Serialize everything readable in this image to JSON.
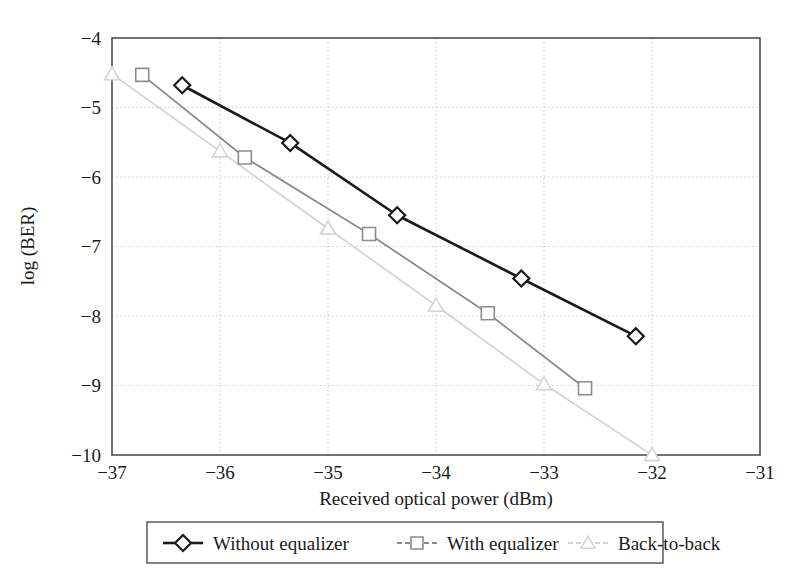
{
  "chart_data": {
    "type": "line",
    "title": "",
    "xlabel": "Received optical power (dBm)",
    "ylabel": "log (BER)",
    "xlim": [
      -37,
      -31
    ],
    "ylim": [
      -10,
      -4
    ],
    "xticks": [
      -37,
      -36,
      -35,
      -34,
      -33,
      -32,
      -31
    ],
    "xtick_labels": [
      "−37",
      "−36",
      "−35",
      "−34",
      "−33",
      "−32",
      "−31"
    ],
    "yticks": [
      -10,
      -9,
      -8,
      -7,
      -6,
      -5,
      -4
    ],
    "ytick_labels": [
      "−10",
      "−9",
      "−8",
      "−7",
      "−6",
      "−5",
      "−4"
    ],
    "grid": true,
    "grid_style": "dotted",
    "legend_position": "below-center",
    "series": [
      {
        "name": "Without equalizer",
        "marker": "diamond",
        "color": "#1a1a1a",
        "x": [
          -36.35,
          -35.35,
          -34.36,
          -33.21,
          -32.15
        ],
        "y": [
          -4.68,
          -5.51,
          -6.55,
          -7.46,
          -8.29
        ]
      },
      {
        "name": "With equalizer",
        "marker": "square",
        "color": "#8c8c8c",
        "x": [
          -36.72,
          -35.77,
          -34.62,
          -33.52,
          -32.62
        ],
        "y": [
          -4.53,
          -5.72,
          -6.82,
          -7.96,
          -9.04
        ]
      },
      {
        "name": "Back-to-back",
        "marker": "triangle",
        "color": "#d4d4d4",
        "x": [
          -37.0,
          -36.0,
          -35.0,
          -34.0,
          -33.0,
          -32.0
        ],
        "y": [
          -4.52,
          -5.63,
          -6.74,
          -7.85,
          -8.98,
          -10.0
        ]
      }
    ]
  },
  "legend": {
    "entries": [
      {
        "label": "Without equalizer",
        "marker": "diamond-icon",
        "color": "#1a1a1a"
      },
      {
        "label": "With equalizer",
        "marker": "square-icon",
        "color": "#8c8c8c"
      },
      {
        "label": "Back-to-back",
        "marker": "triangle-icon",
        "color": "#d4d4d4"
      }
    ]
  }
}
